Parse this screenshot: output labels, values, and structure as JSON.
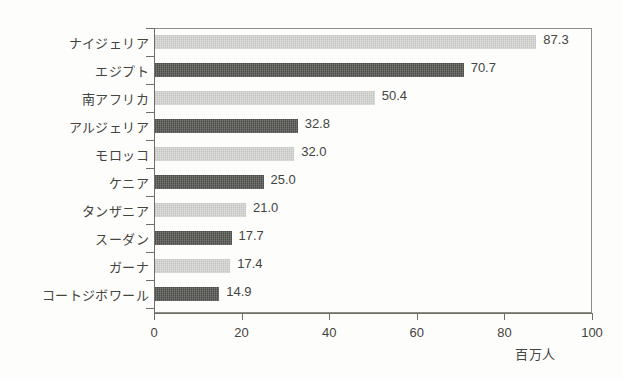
{
  "chart_data": {
    "type": "bar",
    "orientation": "horizontal",
    "title": "",
    "xlabel": "百万人",
    "ylabel": "",
    "xlim": [
      0,
      100
    ],
    "xticks": [
      0,
      20,
      40,
      60,
      80,
      100
    ],
    "grid": false,
    "legend": false,
    "categories": [
      "ナイジェリア",
      "エジプト",
      "南アフリカ",
      "アルジェリア",
      "モロッコ",
      "ケニア",
      "タンザニア",
      "スーダン",
      "ガーナ",
      "コートジボワール"
    ],
    "values": [
      87.3,
      70.7,
      50.4,
      32.8,
      32.0,
      25.0,
      21.0,
      17.7,
      17.4,
      14.9
    ],
    "value_labels": [
      "87.3",
      "70.7",
      "50.4",
      "32.8",
      "32.0",
      "25.0",
      "21.0",
      "17.7",
      "17.4",
      "14.9"
    ],
    "bar_shades": [
      "light",
      "dark",
      "light",
      "dark",
      "light",
      "dark",
      "light",
      "dark",
      "light",
      "dark"
    ],
    "colors": {
      "bar_light": "#c3c3c0",
      "bar_dark": "#4a4a46",
      "axis": "#6f6f68",
      "frame": "#8d8d86",
      "text": "#44443f",
      "background": "#fdfdfb"
    }
  }
}
